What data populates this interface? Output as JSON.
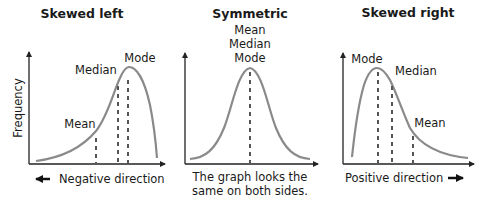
{
  "panels": [
    {
      "title": "Skewed left",
      "y_axis_label": "Frequency",
      "labels": {
        "mean": "Mean",
        "median": "Median",
        "mode": "Mode"
      },
      "caption": "Negative direction",
      "caption_arrow": "left"
    },
    {
      "title": "Symmetric",
      "labels": {
        "mean": "Mean",
        "median": "Median",
        "mode": "Mode"
      },
      "caption_line1": "The graph looks the",
      "caption_line2": "same on both sides."
    },
    {
      "title": "Skewed right",
      "labels": {
        "mode": "Mode",
        "median": "Median",
        "mean": "Mean"
      },
      "caption": "Positive direction",
      "caption_arrow": "right"
    }
  ],
  "colors": {
    "curve": "#8a8a8a",
    "dash": "#555555",
    "axis": "#222222",
    "text": "#1a1a1a"
  }
}
